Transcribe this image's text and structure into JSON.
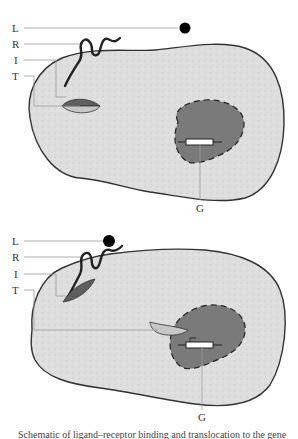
{
  "diagrams": [
    {
      "id": "top",
      "labels": {
        "L": "L",
        "R": "R",
        "I": "I",
        "T": "T",
        "G": "G"
      }
    },
    {
      "id": "bottom",
      "labels": {
        "L": "L",
        "R": "R",
        "I": "I",
        "T": "T",
        "G": "G"
      }
    }
  ],
  "colors": {
    "cell_fill": "#dcdcdc",
    "cell_stroke": "#333333",
    "nucleus_fill": "#7a7a7a",
    "internalized_fill": "#6e6e6e",
    "transporter_fill": "#bdbdbd",
    "gene_fill": "#ffffff",
    "ligand_fill": "#000000",
    "leader_line": "#888888"
  },
  "caption": "Schematic of ligand–receptor binding and translocation to the gene"
}
